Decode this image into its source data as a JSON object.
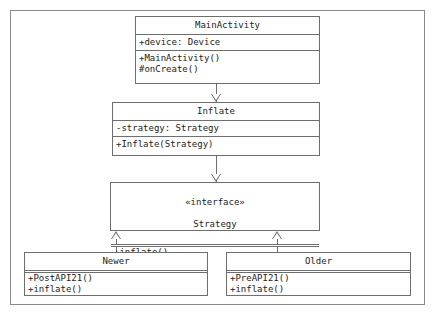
{
  "diagram": {
    "type": "uml-class-diagram",
    "background_color": "#ffffff",
    "line_color": "#6e6e6e",
    "text_color": "#1c1c1c",
    "classes": [
      {
        "id": "main-activity",
        "name": "MainActivity",
        "stereotype": "",
        "attributes": [
          "+device: Device"
        ],
        "operations": [
          "+MainActivity()",
          "#onCreate()"
        ]
      },
      {
        "id": "inflate",
        "name": "Inflate",
        "stereotype": "",
        "attributes": [
          "-strategy: Strategy"
        ],
        "operations": [
          "+Inflate(Strategy)"
        ]
      },
      {
        "id": "strategy",
        "name": "Strategy",
        "stereotype": "«interface»",
        "attributes": [],
        "operations": [
          "+inflate()"
        ]
      },
      {
        "id": "newer",
        "name": "Newer",
        "stereotype": "",
        "attributes": [],
        "operations": [
          "+PostAPI21()",
          "+inflate()"
        ]
      },
      {
        "id": "older",
        "name": "Older",
        "stereotype": "",
        "attributes": [],
        "operations": [
          "+PreAPI21()",
          "+inflate()"
        ]
      }
    ],
    "relationships": [
      {
        "id": "rel-mainactivity-inflate",
        "from": "main-activity",
        "to": "inflate",
        "kind": "generalization",
        "arrow": "hollow-triangle-down"
      },
      {
        "id": "rel-inflate-strategy",
        "from": "inflate",
        "to": "strategy",
        "kind": "generalization",
        "arrow": "hollow-triangle-down"
      },
      {
        "id": "rel-newer-strategy",
        "from": "newer",
        "to": "strategy",
        "kind": "realization",
        "arrow": "hollow-triangle-up"
      },
      {
        "id": "rel-older-strategy",
        "from": "older",
        "to": "strategy",
        "kind": "realization",
        "arrow": "hollow-triangle-up"
      }
    ]
  }
}
